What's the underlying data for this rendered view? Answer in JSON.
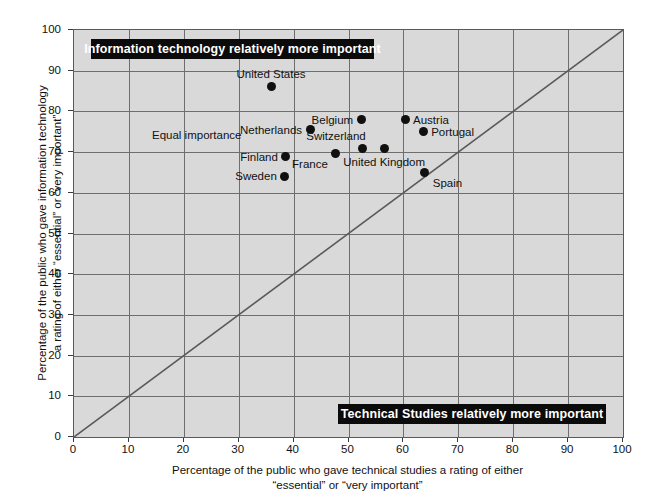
{
  "chart_data": {
    "type": "scatter",
    "title": "",
    "xlabel_lines": [
      "Percentage of the public who gave technical studies a rating of either",
      "“essential” or “very important”"
    ],
    "ylabel_lines": [
      "Percentage of the public who gave information technology",
      "a rating of either “essential” or “very important”"
    ],
    "xlim": [
      0,
      100
    ],
    "ylim": [
      0,
      100
    ],
    "xticks": [
      0,
      10,
      20,
      30,
      40,
      50,
      60,
      70,
      80,
      90,
      100
    ],
    "yticks": [
      0,
      10,
      20,
      30,
      40,
      50,
      60,
      70,
      80,
      90,
      100
    ],
    "grid": true,
    "legend": "none",
    "reference_line": {
      "name": "equal-importance-diagonal",
      "from": [
        0,
        0
      ],
      "to": [
        100,
        100
      ],
      "label": "Equal importance"
    },
    "annotations": [
      {
        "name": "information-technology-banner",
        "text": "Information technology relatively more important",
        "region": "upper-left"
      },
      {
        "name": "technical-studies-banner",
        "text": "Technical Studies relatively more important",
        "region": "lower-right"
      }
    ],
    "points": [
      {
        "label": "United States",
        "x": 35.9,
        "y": 86.0,
        "label_pos": "above"
      },
      {
        "label": "Netherlands",
        "x": 43.0,
        "y": 75.5,
        "label_pos": "left"
      },
      {
        "label": "Belgium",
        "x": 52.3,
        "y": 78.0,
        "label_pos": "left"
      },
      {
        "label": "Austria",
        "x": 60.3,
        "y": 78.0,
        "label_pos": "right"
      },
      {
        "label": "Portugal",
        "x": 63.6,
        "y": 75.0,
        "label_pos": "right"
      },
      {
        "label": "Switzerland",
        "x": 52.6,
        "y": 70.8,
        "label_pos": "above-left"
      },
      {
        "label": "United Kingdom",
        "x": 56.5,
        "y": 70.8,
        "label_pos": "below"
      },
      {
        "label": "France",
        "x": 47.7,
        "y": 69.6,
        "label_pos": "below-left"
      },
      {
        "label": "Finland",
        "x": 38.6,
        "y": 68.8,
        "label_pos": "left"
      },
      {
        "label": "Sweden",
        "x": 38.4,
        "y": 64.1,
        "label_pos": "left"
      },
      {
        "label": "Spain",
        "x": 63.9,
        "y": 65.1,
        "label_pos": "below-right"
      }
    ]
  },
  "colors": {
    "plot_background": "#d9d9d9",
    "gridline": "#6e6e6e",
    "axis_line": "#5a5a5a",
    "point_fill": "#101010",
    "banner_background": "#0b0b0b",
    "banner_text": "#ffffff",
    "text": "#111111"
  }
}
